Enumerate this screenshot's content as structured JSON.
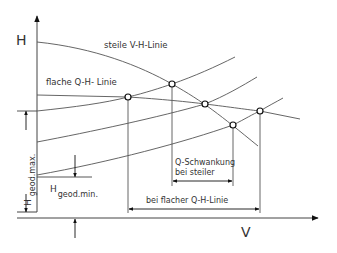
{
  "diagram": {
    "axes": {
      "y_label": "H",
      "x_label": "V"
    },
    "curves": {
      "steep": "steile V-H-Linie",
      "flat": "flache Q-H- Linie"
    },
    "annotations": {
      "h_geod_max_prefix": "H",
      "h_geod_max_sub": "geod.max.",
      "h_geod_min_prefix": "H",
      "h_geod_min_sub": "geod.min.",
      "q_var_line1": "Q-Schwankung",
      "q_var_line2": "bei steiler",
      "q_var_flat": "bei flacher Q-H-Linie"
    },
    "colors": {
      "line": "#555555",
      "text": "#333333"
    }
  }
}
